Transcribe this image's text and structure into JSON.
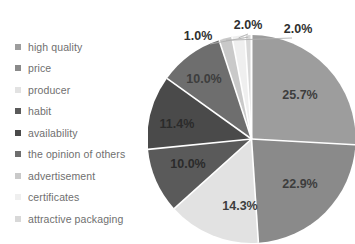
{
  "chart_data": {
    "type": "pie",
    "title": "",
    "subtitle": "",
    "legend_position": "left",
    "grid": false,
    "units": "percent",
    "categories": [
      "high quality",
      "price",
      "producer",
      "habit",
      "availability",
      "the opinion of others",
      "advertisement",
      "certificates",
      "attractive packaging"
    ],
    "values": [
      25.7,
      22.9,
      14.3,
      10.0,
      11.4,
      10.0,
      2.0,
      2.0,
      1.0
    ],
    "value_labels": [
      "25.7%",
      "22.9%",
      "14.3%",
      "10.0%",
      "11.4%",
      "10.0%",
      "2.0%",
      "2.0%",
      "1.0%"
    ],
    "colors": [
      "#9d9d9d",
      "#8a8a8a",
      "#e2e2e2",
      "#5a5a5a",
      "#4a4a4a",
      "#6e6e6e",
      "#c9c9c9",
      "#efefef",
      "#d8d8d8"
    ],
    "separator_color": "#ffffff",
    "background_color": "#ffffff",
    "label_color": "#3d3d3d",
    "legend_text_color": "#6f6f6f",
    "start_angle_deg": 0,
    "direction": "clockwise",
    "total": 99.3
  },
  "legend": {
    "items": [
      {
        "label": "high quality",
        "color": "#9d9d9d"
      },
      {
        "label": "price",
        "color": "#8a8a8a"
      },
      {
        "label": "producer",
        "color": "#e2e2e2"
      },
      {
        "label": "habit",
        "color": "#5a5a5a"
      },
      {
        "label": "availability",
        "color": "#4a4a4a"
      },
      {
        "label": "the opinion of others",
        "color": "#6e6e6e"
      },
      {
        "label": "advertisement",
        "color": "#c9c9c9"
      },
      {
        "label": "certificates",
        "color": "#efefef"
      },
      {
        "label": "attractive packaging",
        "color": "#d8d8d8"
      }
    ]
  },
  "pie_labels": {
    "inside": [
      {
        "text": "25.7%",
        "slice": "high quality"
      },
      {
        "text": "22.9%",
        "slice": "price"
      },
      {
        "text": "14.3%",
        "slice": "producer"
      },
      {
        "text": "10.0%",
        "slice": "habit"
      },
      {
        "text": "11.4%",
        "slice": "availability"
      },
      {
        "text": "10.0%",
        "slice": "the opinion of others"
      }
    ],
    "callouts": [
      {
        "text": "1.0%",
        "slice": "attractive packaging"
      },
      {
        "text": "2.0%",
        "slice": "certificates"
      },
      {
        "text": "2.0%",
        "slice": "advertisement"
      }
    ]
  }
}
